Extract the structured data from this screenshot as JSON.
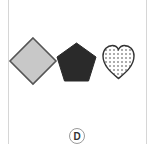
{
  "option": {
    "label": "D",
    "shapes": [
      {
        "name": "diamond",
        "fill": "gray",
        "fill_color": "#c8c8c8",
        "stroke_color": "#555555"
      },
      {
        "name": "pentagon",
        "fill": "black",
        "fill_color": "#2a2a2a",
        "stroke_color": "#2a2a2a"
      },
      {
        "name": "heart",
        "fill": "dotted",
        "fill_color": "#ffffff",
        "stroke_color": "#333333"
      }
    ]
  }
}
